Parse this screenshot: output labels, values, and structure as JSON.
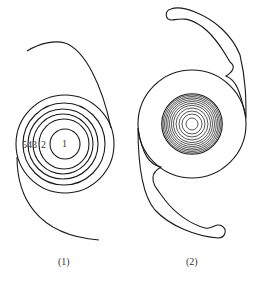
{
  "figure_1": {
    "caption": "(1)",
    "ring_labels": {
      "ring_1": "1",
      "ring_2": "2",
      "ring_3": "3",
      "ring_4": "4",
      "ring_5": "5"
    },
    "center": [
      65,
      144
    ],
    "ring_radii": [
      15,
      25,
      30,
      35,
      41,
      49
    ]
  },
  "figure_2": {
    "caption": "(2)",
    "optic_center": [
      192,
      124
    ],
    "optic_radius": 54,
    "inner_rings": 12
  },
  "colors": {
    "line": "#1a1a1a",
    "background": "#ffffff"
  }
}
